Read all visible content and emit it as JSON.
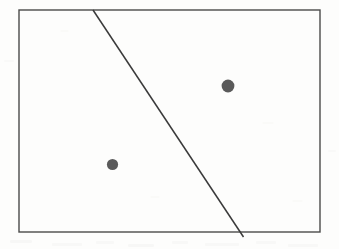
{
  "figure": {
    "kind": "line-diagram",
    "canvas": {
      "width": 339,
      "height": 249
    },
    "background_color": "#fdfdfc",
    "ink_color": "#3a3a3a",
    "dot_color": "#5a5a5a"
  },
  "chart_data": {
    "type": "scatter",
    "title": "",
    "subtitle": "",
    "xlabel": "",
    "ylabel": "",
    "grid": false,
    "legend": "none",
    "axis_ranges": {
      "x": [
        19,
        320
      ],
      "y": [
        10,
        232
      ]
    },
    "frame": {
      "name": "bounding-rectangle",
      "x": 19,
      "y": 10,
      "width": 301,
      "height": 222,
      "stroke": "#4a4a4a",
      "stroke_width": 1.4,
      "fill": "none"
    },
    "annotations": [
      {
        "name": "separating-line",
        "type": "line",
        "x1": 93,
        "y1": 10,
        "x2": 243.5,
        "y2": 237,
        "stroke": "#3a3a3a",
        "stroke_width": 1.5,
        "note": "diagonal line descending left-to-right, meeting the top edge and passing just beyond the bottom edge"
      }
    ],
    "points": [
      {
        "name": "point-upper-right",
        "x": 228,
        "y": 86,
        "r": 6.4,
        "color": "#5a5a5a",
        "side": "right-of-line"
      },
      {
        "name": "point-lower-left",
        "x": 112.5,
        "y": 164.5,
        "r": 5.6,
        "color": "#5a5a5a",
        "side": "left-of-line"
      }
    ]
  },
  "speckles": [
    {
      "x": 10,
      "y": 240,
      "w": 22,
      "h": 3,
      "o": 0.1
    },
    {
      "x": 52,
      "y": 243,
      "w": 30,
      "h": 3,
      "o": 0.09
    },
    {
      "x": 96,
      "y": 241,
      "w": 18,
      "h": 3,
      "o": 0.08
    },
    {
      "x": 128,
      "y": 244,
      "w": 26,
      "h": 3,
      "o": 0.1
    },
    {
      "x": 172,
      "y": 241,
      "w": 16,
      "h": 3,
      "o": 0.08
    },
    {
      "x": 205,
      "y": 243,
      "w": 34,
      "h": 3,
      "o": 0.09
    },
    {
      "x": 256,
      "y": 241,
      "w": 20,
      "h": 3,
      "o": 0.08
    },
    {
      "x": 288,
      "y": 244,
      "w": 30,
      "h": 3,
      "o": 0.09
    },
    {
      "x": 4,
      "y": 60,
      "w": 10,
      "h": 2,
      "o": 0.06
    },
    {
      "x": 328,
      "y": 150,
      "w": 8,
      "h": 2,
      "o": 0.06
    },
    {
      "x": 60,
      "y": 30,
      "w": 9,
      "h": 2,
      "o": 0.05
    },
    {
      "x": 262,
      "y": 122,
      "w": 12,
      "h": 2,
      "o": 0.05
    },
    {
      "x": 150,
      "y": 196,
      "w": 10,
      "h": 2,
      "o": 0.05
    },
    {
      "x": 292,
      "y": 200,
      "w": 11,
      "h": 2,
      "o": 0.05
    }
  ]
}
